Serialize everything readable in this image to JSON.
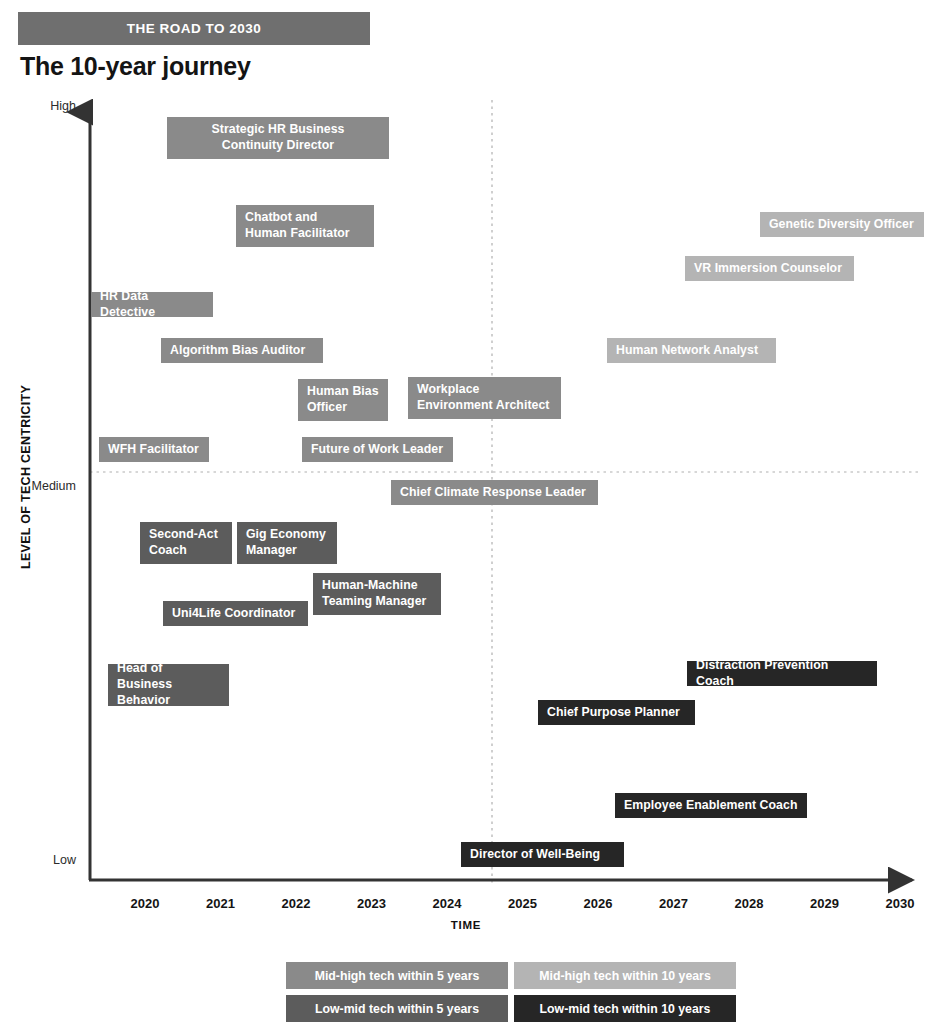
{
  "header": {
    "kicker": "THE ROAD TO 2030",
    "title": "The 10-year journey"
  },
  "chart_data": {
    "type": "scatter",
    "title": "The 10-year journey",
    "subtitle": "THE ROAD TO 2030",
    "xlabel": "TIME",
    "ylabel": "LEVEL OF TECH CENTRICITY",
    "x_ticks": [
      "2020",
      "2021",
      "2022",
      "2023",
      "2024",
      "2025",
      "2026",
      "2027",
      "2028",
      "2029",
      "2030"
    ],
    "y_ticks": [
      "High",
      "Medium",
      "Low"
    ],
    "xlim": [
      2019.6,
      2030.4
    ],
    "ylim": [
      "Low",
      "High"
    ],
    "grid": "dotted crosshair at x=2024.7, y=Medium",
    "legend_position": "below-plot",
    "colors": {
      "mid_high_5": "#8a8a8a",
      "mid_high_10": "#b4b4b4",
      "low_mid_5": "#5c5c5c",
      "low_mid_10": "#262626",
      "banner": "#6f6f6f",
      "axis": "#333333"
    },
    "legend": [
      {
        "key": "mid_high_5",
        "label": "Mid-high tech within 5 years",
        "color": "#8a8a8a"
      },
      {
        "key": "mid_high_10",
        "label": "Mid-high tech within 10 years",
        "color": "#b4b4b4"
      },
      {
        "key": "low_mid_5",
        "label": "Low-mid tech within 5 years",
        "color": "#5c5c5c"
      },
      {
        "key": "low_mid_10",
        "label": "Low-mid tech within 10 years",
        "color": "#262626"
      }
    ],
    "points": [
      {
        "label": "Strategic HR Business\nContinuity Director",
        "category": "mid_high_5",
        "x": 2021.0,
        "y": "High",
        "px": 167,
        "py": 117,
        "w": 222,
        "h": 42,
        "align": "center"
      },
      {
        "label": "Chatbot and\nHuman Facilitator",
        "category": "mid_high_5",
        "x": 2021.7,
        "y": "High-",
        "px": 236,
        "py": 205,
        "w": 138,
        "h": 42,
        "align": "left"
      },
      {
        "label": "HR Data Detective",
        "category": "mid_high_5",
        "x": 2019.7,
        "y": "Mid-high+",
        "px": 91,
        "py": 292,
        "w": 122,
        "h": 25,
        "align": "left"
      },
      {
        "label": "Algorithm Bias Auditor",
        "category": "mid_high_5",
        "x": 2020.9,
        "y": "Mid-high",
        "px": 161,
        "py": 338,
        "w": 162,
        "h": 25,
        "align": "left"
      },
      {
        "label": "Human Bias\nOfficer",
        "category": "mid_high_5",
        "x": 2022.3,
        "y": "Mid-high-",
        "px": 298,
        "py": 379,
        "w": 90,
        "h": 42,
        "align": "left"
      },
      {
        "label": "Workplace\nEnvironment Architect",
        "category": "mid_high_5",
        "x": 2023.4,
        "y": "Mid-high-",
        "px": 408,
        "py": 377,
        "w": 153,
        "h": 42,
        "align": "left"
      },
      {
        "label": "WFH Facilitator",
        "category": "mid_high_5",
        "x": 2019.8,
        "y": "Medium+",
        "px": 99,
        "py": 437,
        "w": 110,
        "h": 25,
        "align": "left"
      },
      {
        "label": "Future of Work Leader",
        "category": "mid_high_5",
        "x": 2022.3,
        "y": "Medium+",
        "px": 302,
        "py": 437,
        "w": 151,
        "h": 25,
        "align": "left"
      },
      {
        "label": "Chief Climate Response Leader",
        "category": "mid_high_5",
        "x": 2024.2,
        "y": "Medium-",
        "px": 391,
        "py": 480,
        "w": 207,
        "h": 25,
        "align": "left"
      },
      {
        "label": "Genetic Diversity Officer",
        "category": "mid_high_10",
        "x": 2028.8,
        "y": "High-",
        "px": 760,
        "py": 212,
        "w": 164,
        "h": 25,
        "align": "left"
      },
      {
        "label": "VR Immersion Counselor",
        "category": "mid_high_10",
        "x": 2027.7,
        "y": "High--",
        "px": 685,
        "py": 256,
        "w": 169,
        "h": 25,
        "align": "left"
      },
      {
        "label": "Human Network Analyst",
        "category": "mid_high_10",
        "x": 2026.4,
        "y": "Mid-high",
        "px": 607,
        "py": 338,
        "w": 169,
        "h": 25,
        "align": "left"
      },
      {
        "label": "Second-Act\nCoach",
        "category": "low_mid_5",
        "x": 2020.5,
        "y": "Medium--",
        "px": 140,
        "py": 522,
        "w": 92,
        "h": 42,
        "align": "left"
      },
      {
        "label": "Gig Economy\nManager",
        "category": "low_mid_5",
        "x": 2021.3,
        "y": "Medium--",
        "px": 237,
        "py": 522,
        "w": 100,
        "h": 42,
        "align": "left"
      },
      {
        "label": "Human-Machine\nTeaming Manager",
        "category": "low_mid_5",
        "x": 2022.5,
        "y": "Low-mid+",
        "px": 313,
        "py": 573,
        "w": 128,
        "h": 42,
        "align": "left"
      },
      {
        "label": "Uni4Life Coordinator",
        "category": "low_mid_5",
        "x": 2021.0,
        "y": "Low-mid",
        "px": 163,
        "py": 601,
        "w": 145,
        "h": 25,
        "align": "left"
      },
      {
        "label": "Head of Business\nBehavior",
        "category": "low_mid_5",
        "x": 2019.9,
        "y": "Low-mid-",
        "px": 108,
        "py": 664,
        "w": 121,
        "h": 42,
        "align": "left"
      },
      {
        "label": "Distraction Prevention Coach",
        "category": "low_mid_10",
        "x": 2027.3,
        "y": "Low-mid-",
        "px": 687,
        "py": 661,
        "w": 190,
        "h": 25,
        "align": "left"
      },
      {
        "label": "Chief Purpose Planner",
        "category": "low_mid_10",
        "x": 2025.7,
        "y": "Low-mid--",
        "px": 538,
        "py": 700,
        "w": 157,
        "h": 25,
        "align": "left"
      },
      {
        "label": "Employee Enablement Coach",
        "category": "low_mid_10",
        "x": 2026.8,
        "y": "Low+",
        "px": 615,
        "py": 793,
        "w": 192,
        "h": 25,
        "align": "left"
      },
      {
        "label": "Director of Well-Being",
        "category": "low_mid_10",
        "x": 2024.6,
        "y": "Low",
        "px": 461,
        "py": 842,
        "w": 163,
        "h": 25,
        "align": "left"
      }
    ]
  }
}
